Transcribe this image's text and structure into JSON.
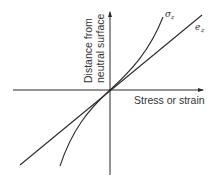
{
  "diagram": {
    "type": "stress-strain distribution through beam depth",
    "x_axis": {
      "label": "Stress or strain"
    },
    "y_axis": {
      "label_line1": "Distance from",
      "label_line2": "neutral surface"
    },
    "curves": [
      {
        "id": "sigma",
        "symbol": "σ",
        "subscript": "z",
        "shape": "nonlinear (cubic-like) through origin"
      },
      {
        "id": "strain",
        "symbol": "e",
        "subscript": "z",
        "shape": "straight line through origin"
      }
    ],
    "colors": {
      "line": "#2a2a2a",
      "text": "#333333",
      "background": "#ffffff"
    }
  }
}
